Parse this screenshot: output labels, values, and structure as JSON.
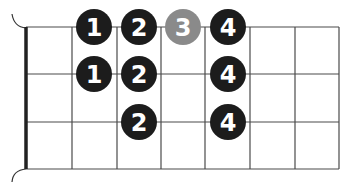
{
  "diagram": {
    "type": "fretboard-fingering-chart",
    "strings_x": [
      26,
      72,
      117,
      161,
      205,
      250,
      295,
      339
    ],
    "frets_y": [
      27,
      74,
      122,
      169
    ],
    "colors": {
      "grid": "#4a4a4a",
      "nut": "#222222",
      "dot_primary": "#1c1c1c",
      "dot_secondary": "#8a8a8a",
      "dot_text": "#ffffff"
    },
    "dots": [
      {
        "label": "1",
        "x": 94,
        "y": 27,
        "style": "primary"
      },
      {
        "label": "2",
        "x": 139,
        "y": 27,
        "style": "primary"
      },
      {
        "label": "3",
        "x": 183,
        "y": 27,
        "style": "secondary"
      },
      {
        "label": "4",
        "x": 228,
        "y": 27,
        "style": "primary"
      },
      {
        "label": "1",
        "x": 94,
        "y": 74,
        "style": "primary"
      },
      {
        "label": "2",
        "x": 139,
        "y": 74,
        "style": "primary"
      },
      {
        "label": "4",
        "x": 228,
        "y": 74,
        "style": "primary"
      },
      {
        "label": "2",
        "x": 139,
        "y": 122,
        "style": "primary"
      },
      {
        "label": "4",
        "x": 228,
        "y": 122,
        "style": "primary"
      }
    ]
  }
}
